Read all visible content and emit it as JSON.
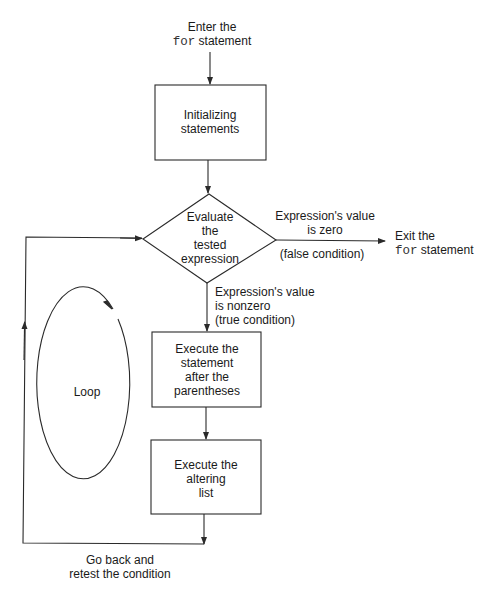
{
  "diagram": {
    "type": "flowchart",
    "colors": {
      "stroke": "#2a2a2a",
      "text": "#1a1a1a",
      "background": "#ffffff"
    },
    "entry": {
      "line1": "Enter the",
      "keyword": "for",
      "line2_rest": " statement"
    },
    "nodes": {
      "init": {
        "shape": "rectangle",
        "lines": [
          "Initializing",
          "statements"
        ]
      },
      "test": {
        "shape": "diamond",
        "lines": [
          "Evaluate",
          "the",
          "tested",
          "expression"
        ]
      },
      "body": {
        "shape": "rectangle",
        "lines": [
          "Execute the",
          "statement",
          "after the",
          "parentheses"
        ]
      },
      "alter": {
        "shape": "rectangle",
        "lines": [
          "Execute the",
          "altering",
          "list"
        ]
      }
    },
    "edges": {
      "false_branch": {
        "line1": "Expression's value",
        "line2": "is zero",
        "line3": "(false condition)"
      },
      "true_branch": {
        "line1": "Expression's value",
        "line2": "is nonzero",
        "line3": "(true condition)"
      },
      "exit": {
        "line1": "Exit the",
        "keyword": "for",
        "line2_rest": " statement"
      },
      "return": {
        "line1": "Go back and",
        "line2": "retest the condition"
      }
    },
    "loop_label": "Loop"
  }
}
